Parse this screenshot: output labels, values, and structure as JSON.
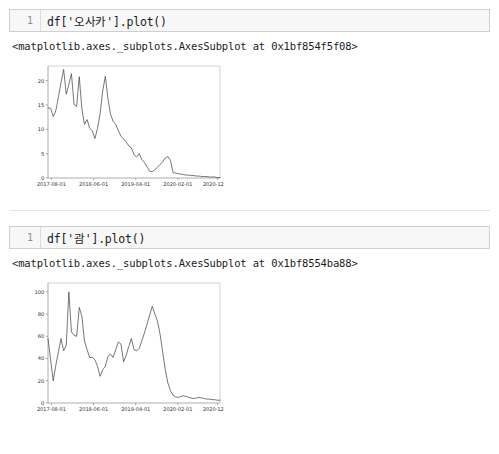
{
  "notebook": {
    "cells": [
      {
        "prompt": "1",
        "code": "df['오사카'].plot()",
        "output_text": "<matplotlib.axes._subplots.AxesSubplot at 0x1bf854f5f08>"
      },
      {
        "prompt": "1",
        "code": "df['괌'].plot()",
        "output_text": "<matplotlib.axes._subplots.AxesSubplot at 0x1bf8554ba88>"
      }
    ]
  },
  "chart_data": [
    {
      "type": "line",
      "title": "",
      "xlabel": "",
      "ylabel": "",
      "grid": false,
      "legend": false,
      "line_color": "#4a4a4a",
      "xticklabels": [
        "2017-08-01",
        "2018-06-01",
        "2019-04-01",
        "2020-02-01",
        "2020-12-01"
      ],
      "yticklabels": [
        "0",
        "5",
        "10",
        "15",
        "20"
      ],
      "ylim": [
        0,
        23
      ],
      "xlim": [
        0,
        66
      ],
      "series": [
        {
          "name": "오사카",
          "values": [
            14.4,
            14.3,
            12.6,
            13.8,
            16.6,
            19.6,
            22.3,
            17.2,
            19.2,
            21.4,
            15.1,
            14.7,
            20.8,
            14.2,
            11.0,
            12.0,
            10.2,
            9.7,
            8.1,
            10.2,
            13.2,
            17.9,
            20.9,
            16.3,
            13.1,
            11.6,
            11.0,
            9.7,
            8.6,
            8.0,
            7.4,
            6.6,
            6.2,
            4.8,
            4.3,
            5.0,
            3.8,
            3.2,
            2.3,
            1.4,
            1.3,
            1.7,
            2.2,
            2.8,
            3.3,
            4.1,
            4.4,
            3.6,
            1.1,
            1.0,
            0.9,
            0.8,
            0.7,
            0.6,
            0.6,
            0.5,
            0.5,
            0.4,
            0.4,
            0.3,
            0.3,
            0.3,
            0.2,
            0.2,
            0.2,
            0.1,
            0.1
          ]
        }
      ]
    },
    {
      "type": "line",
      "title": "",
      "xlabel": "",
      "ylabel": "",
      "grid": false,
      "legend": false,
      "line_color": "#4a4a4a",
      "xticklabels": [
        "2017-08-01",
        "2018-06-01",
        "2019-04-01",
        "2020-02-01",
        "2020-12-01"
      ],
      "yticklabels": [
        "0",
        "20",
        "40",
        "60",
        "80",
        "100"
      ],
      "ylim": [
        0,
        108
      ],
      "xlim": [
        0,
        66
      ],
      "series": [
        {
          "name": "괌",
          "values": [
            58.0,
            39.0,
            20.0,
            34.0,
            46.0,
            58.0,
            47.0,
            52.0,
            100.0,
            64.0,
            61.0,
            60.0,
            86.0,
            78.0,
            56.0,
            48.0,
            41.0,
            41.0,
            39.0,
            33.0,
            24.0,
            30.0,
            33.0,
            42.0,
            44.0,
            41.0,
            48.0,
            55.0,
            53.0,
            37.0,
            43.0,
            51.0,
            58.0,
            48.0,
            47.0,
            49.0,
            56.0,
            63.0,
            71.0,
            79.0,
            87.0,
            80.0,
            74.0,
            62.0,
            46.0,
            30.0,
            18.0,
            11.0,
            7.0,
            5.5,
            5.0,
            6.0,
            6.5,
            6.0,
            5.0,
            4.5,
            4.0,
            4.5,
            5.0,
            4.5,
            4.0,
            3.5,
            3.5,
            3.0,
            3.0,
            2.5,
            2.5
          ]
        }
      ]
    }
  ]
}
